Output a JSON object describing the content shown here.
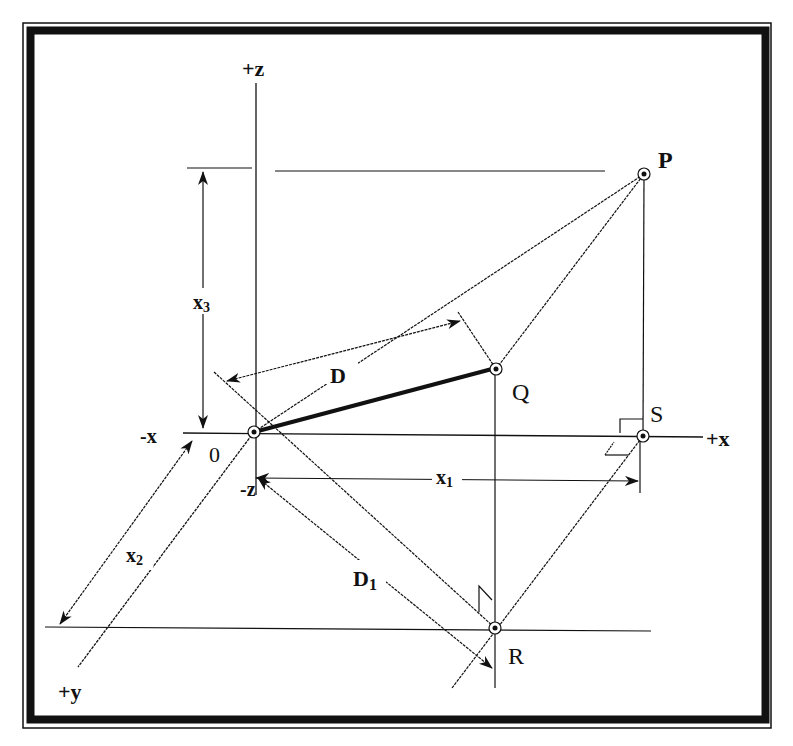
{
  "figure": {
    "type": "3d-coordinate-geometry"
  },
  "axes": {
    "pos_z": "+z",
    "neg_z": "-z",
    "pos_x": "+x",
    "neg_x": "-x",
    "pos_y": "+y",
    "origin": "0"
  },
  "points": {
    "P": "P",
    "Q": "Q",
    "R": "R",
    "S": "S"
  },
  "dimensions": {
    "x1": {
      "base": "x",
      "sub": "1"
    },
    "x2": {
      "base": "x",
      "sub": "2"
    },
    "x3": {
      "base": "x",
      "sub": "3"
    },
    "D": {
      "base": "D",
      "sub": ""
    },
    "D1": {
      "base": "D",
      "sub": "1"
    }
  },
  "colors": {
    "ink": "#111111",
    "background": "#ffffff",
    "frame": "#111111"
  }
}
